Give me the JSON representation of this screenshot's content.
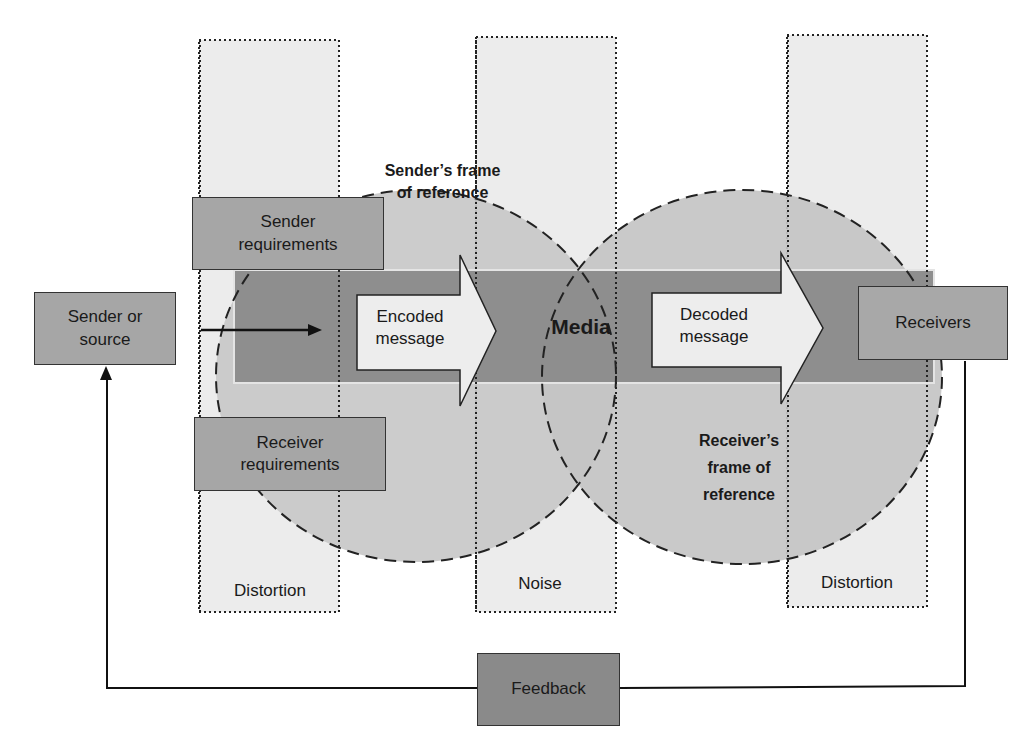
{
  "diagram": {
    "type": "communication-process-model",
    "colors": {
      "background": "#ffffff",
      "column_fill": "#ececec",
      "circle_fill": "#c8c8c8",
      "channel_fill": "#8e8e8e",
      "channel_edge": "#e4e4e4",
      "box_fill": "#a6a6a6",
      "feedback_fill": "#8a8a8a",
      "arrow_fill": "#ededed",
      "stroke": "#1a1a1a"
    },
    "nodes": {
      "sender": "Sender or\nsource",
      "receivers": "Receivers",
      "sender_requirements": "Sender\nrequirements",
      "receiver_requirements": "Receiver\nrequirements",
      "feedback": "Feedback",
      "encoded_message": "Encoded\nmessage",
      "decoded_message": "Decoded\nmessage",
      "media": "Media"
    },
    "regions": {
      "sender_frame": "Sender’s frame\nof reference",
      "receiver_frame": "Receiver’s\nframe of\nreference"
    },
    "columns": [
      {
        "label": "Distortion"
      },
      {
        "label": "Noise"
      },
      {
        "label": "Distortion"
      }
    ],
    "edges": [
      {
        "from": "sender",
        "to": "encoded_message",
        "style": "arrow"
      },
      {
        "from": "encoded_message",
        "to": "decoded_message",
        "via": "media"
      },
      {
        "from": "decoded_message",
        "to": "receivers",
        "style": "arrow"
      },
      {
        "from": "receivers",
        "to": "feedback",
        "style": "line"
      },
      {
        "from": "feedback",
        "to": "sender",
        "style": "arrow"
      }
    ]
  }
}
